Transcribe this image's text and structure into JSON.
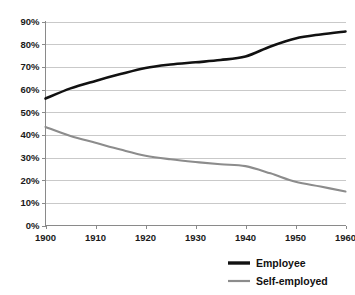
{
  "chart_data": {
    "type": "line",
    "title": "",
    "subtitle": "",
    "xlabel": "",
    "ylabel": "",
    "xlim": [
      1900,
      1960
    ],
    "ylim": [
      0,
      90
    ],
    "grid": true,
    "legend_position": "bottom-right",
    "x_tick_labels": [
      "1900",
      "1910",
      "1920",
      "1930",
      "1940",
      "1950",
      "1960"
    ],
    "x_ticks": [
      1900,
      1910,
      1920,
      1930,
      1940,
      1950,
      1960
    ],
    "y_tick_labels": [
      "0%",
      "10%",
      "20%",
      "30%",
      "40%",
      "50%",
      "60%",
      "70%",
      "80%",
      "90%"
    ],
    "y_ticks": [
      0,
      10,
      20,
      30,
      40,
      50,
      60,
      70,
      80,
      90
    ],
    "x": [
      1900,
      1905,
      1910,
      1915,
      1920,
      1925,
      1930,
      1935,
      1940,
      1945,
      1950,
      1955,
      1960
    ],
    "series": [
      {
        "name": "Employee",
        "color": "#111111",
        "width": 2.6,
        "values": [
          56.0,
          60.5,
          63.8,
          66.8,
          69.5,
          71.0,
          72.0,
          73.0,
          74.6,
          79.0,
          82.5,
          84.3,
          85.6
        ]
      },
      {
        "name": "Self-employed",
        "color": "#8c8c8c",
        "width": 2.1,
        "values": [
          43.5,
          39.5,
          36.5,
          33.5,
          30.8,
          29.2,
          28.0,
          27.0,
          26.2,
          23.0,
          19.3,
          17.2,
          15.0
        ]
      }
    ]
  },
  "legend": {
    "items": [
      {
        "label": "Employee",
        "color": "#111111",
        "width": 3.4
      },
      {
        "label": "Self-employed",
        "color": "#8c8c8c",
        "width": 2.2
      }
    ]
  }
}
